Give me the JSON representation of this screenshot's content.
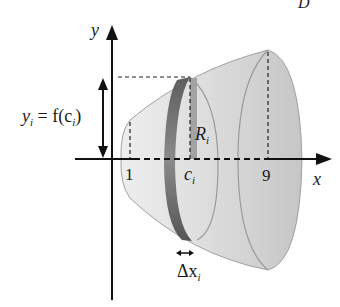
{
  "figure": {
    "corner_label": "D",
    "axes": {
      "x_label": "x",
      "y_label": "y"
    },
    "ticks": {
      "left": "1",
      "right": "9",
      "ci_main": "c",
      "ci_sub": "i"
    },
    "annotations": {
      "yi_lhs_main": "y",
      "yi_lhs_sub": "i",
      "yi_eq": " = f(c",
      "yi_eq_sub": "i",
      "yi_close": ")",
      "radius_main": "R",
      "radius_sub": "i",
      "delta_main": "Δx",
      "delta_sub": "i"
    },
    "colors": {
      "solid_light": "#e6e6e6",
      "solid_mid": "#cfcfcf",
      "solid_edge": "#9a9a9a",
      "disk_dark": "#6e6e6e",
      "radius_bar": "#9e9e9e",
      "axis": "#111111"
    }
  }
}
